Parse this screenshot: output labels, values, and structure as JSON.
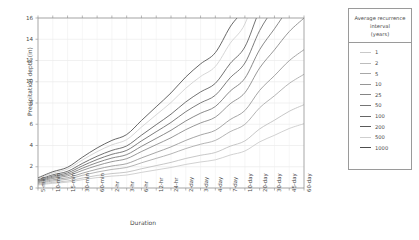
{
  "chart_data": {
    "type": "line",
    "title": "",
    "xlabel": "Duration",
    "ylabel": "Precipitation depth (in)",
    "ylim": [
      0,
      16
    ],
    "ytick_values": [
      0,
      2,
      4,
      6,
      8,
      10,
      12,
      14,
      16
    ],
    "grid": true,
    "legend_position": "right",
    "legend_title": "Average recurrence interval (years)",
    "legend_title_lines": [
      "Average recurrence",
      "interval",
      "(years)"
    ],
    "categories": [
      "5-min",
      "10-min",
      "15-min",
      "30-min",
      "60-min",
      "2-hr",
      "3-hr",
      "6-hr",
      "12-hr",
      "24-hr",
      "2-day",
      "3-day",
      "4-day",
      "7-day",
      "10-day",
      "20-day",
      "30-day",
      "45-day",
      "60-day"
    ],
    "series": [
      {
        "name": "1",
        "color": "#c9c9c9",
        "values": [
          0.28,
          0.44,
          0.55,
          0.78,
          0.98,
          1.12,
          1.22,
          1.47,
          1.7,
          1.93,
          2.22,
          2.45,
          2.65,
          3.1,
          3.48,
          4.34,
          4.96,
          5.6,
          6.05
        ]
      },
      {
        "name": "2",
        "color": "#bdbdbd",
        "values": [
          0.34,
          0.53,
          0.66,
          0.94,
          1.18,
          1.36,
          1.49,
          1.81,
          2.11,
          2.41,
          2.78,
          3.08,
          3.34,
          3.93,
          4.43,
          5.56,
          6.38,
          7.22,
          7.84
        ]
      },
      {
        "name": "5",
        "color": "#a8a8a8",
        "values": [
          0.42,
          0.66,
          0.83,
          1.19,
          1.5,
          1.75,
          1.93,
          2.37,
          2.79,
          3.21,
          3.71,
          4.12,
          4.48,
          5.3,
          5.99,
          7.55,
          8.68,
          9.84,
          10.7
        ]
      },
      {
        "name": "10",
        "color": "#969696",
        "values": [
          0.49,
          0.77,
          0.97,
          1.39,
          1.77,
          2.07,
          2.29,
          2.83,
          3.35,
          3.87,
          4.48,
          4.99,
          5.43,
          6.44,
          7.29,
          9.19,
          10.57,
          11.98,
          13.02
        ]
      },
      {
        "name": "25",
        "color": "#858585",
        "values": [
          0.57,
          0.9,
          1.14,
          1.65,
          2.11,
          2.48,
          2.76,
          3.43,
          4.08,
          4.73,
          5.49,
          6.12,
          6.67,
          7.92,
          8.97,
          11.3,
          13.0,
          14.72,
          15.99
        ]
      },
      {
        "name": "50",
        "color": "#757575",
        "values": [
          0.64,
          1.01,
          1.28,
          1.86,
          2.39,
          2.82,
          3.14,
          3.92,
          4.67,
          5.43,
          6.31,
          7.04,
          7.67,
          9.11,
          10.33,
          13.02,
          14.98,
          16.95,
          18.41
        ]
      },
      {
        "name": "100",
        "color": "#666666",
        "values": [
          0.71,
          1.12,
          1.42,
          2.08,
          2.68,
          3.17,
          3.54,
          4.43,
          5.3,
          6.17,
          7.18,
          8.01,
          8.73,
          10.37,
          11.76,
          14.82,
          17.05,
          19.29,
          20.95
        ]
      },
      {
        "name": "200",
        "color": "#5a5a5a",
        "values": [
          0.78,
          1.24,
          1.57,
          2.31,
          2.99,
          3.54,
          3.96,
          4.97,
          5.96,
          6.95,
          8.1,
          9.04,
          9.85,
          11.71,
          13.28,
          16.74,
          19.26,
          21.79,
          23.67
        ]
      },
      {
        "name": "500",
        "color": "#cfcfcf",
        "values": [
          0.88,
          1.4,
          1.78,
          2.63,
          3.42,
          4.06,
          4.55,
          5.73,
          6.89,
          8.05,
          9.39,
          10.49,
          11.44,
          13.61,
          15.44,
          19.47,
          22.41,
          25.35,
          27.54
        ]
      },
      {
        "name": "1000",
        "color": "#4d4d4d",
        "values": [
          0.96,
          1.53,
          1.95,
          2.89,
          3.77,
          4.48,
          5.03,
          6.35,
          7.65,
          8.95,
          10.45,
          11.68,
          12.74,
          15.16,
          17.21,
          21.71,
          24.98,
          28.26,
          30.7
        ]
      }
    ]
  }
}
